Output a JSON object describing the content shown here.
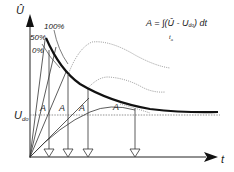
{
  "diagram": {
    "type": "volt-time area characteristic",
    "axes": {
      "y_label": "Û",
      "x_label": "t"
    },
    "curve_labels": {
      "p100": "100%",
      "p50": "50%",
      "p0": "0%"
    },
    "threshold": {
      "label_main": "U",
      "label_sub": "do"
    },
    "area_labels": [
      "A",
      "A",
      "A",
      "A"
    ],
    "formula": {
      "lhs": "A = ∫(Û - U",
      "sub": "do",
      "rhs": ") dt",
      "lower_limit": "t",
      "lower_limit_sub": "a"
    },
    "colors": {
      "line": "#222222",
      "dotted": "#555555",
      "background": "#ffffff"
    }
  }
}
